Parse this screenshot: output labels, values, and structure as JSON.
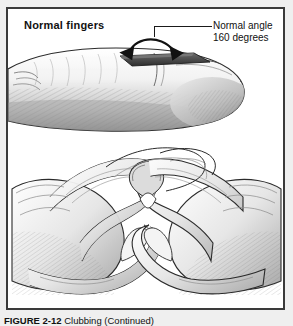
{
  "figure": {
    "title_label": "Normal fingers",
    "angle_label_line1": "Normal angle",
    "angle_label_line2": "160 degrees",
    "caption_number": "FIGURE 2-12",
    "caption_text": "Clubbing (Continued)",
    "angle_degrees": 160,
    "border_color": "#3a3a3a",
    "page_background": "#efefef",
    "frame_background": "#ffffff",
    "ink_color": "#1a1a1a",
    "nail_color": "#3f3f3f"
  },
  "illustrations": {
    "profile_view": {
      "name": "finger-profile-lateral-view",
      "description": "Lateral profile of a normal index finger showing the nail plate and nail bed forming a 160 degree angle"
    },
    "schamroth_view": {
      "name": "schamroth-window-two-hands",
      "description": "Two hands with the dorsal surfaces of opposing index fingers placed together, nail to nail, forming a diamond shaped window"
    }
  }
}
